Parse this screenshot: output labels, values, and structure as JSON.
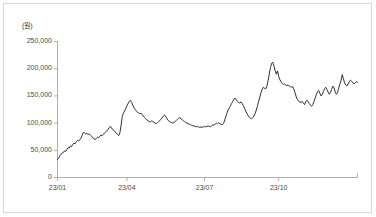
{
  "chart_data": {
    "type": "line",
    "title": "",
    "subtitle": "",
    "unit_label": "(원)",
    "xlabel": "",
    "ylabel": "",
    "ylim": [
      0,
      250000
    ],
    "xlim": [
      "23/01",
      "23/12"
    ],
    "grid": false,
    "legend": null,
    "legend_position": "none",
    "line_color": "#1a1a1a",
    "axis_color": "#9a9a9a",
    "frame_color": "#d8d8d8",
    "background_color": "#ffffff",
    "ytick_labels": [
      "250,000",
      "200,000",
      "150,000",
      "100,000",
      "50,000",
      "0"
    ],
    "ytick_values": [
      250000,
      200000,
      150000,
      100000,
      50000,
      0
    ],
    "xtick_labels": [
      "23/01",
      "23/04",
      "23/07",
      "23/10"
    ],
    "xtick_values": [
      0,
      59,
      125,
      188
    ],
    "x_index_max": 250,
    "annotations": [],
    "series": [
      {
        "name": "price",
        "values": [
          33000,
          36000,
          40000,
          43000,
          45000,
          46000,
          49000,
          48000,
          52000,
          55000,
          54000,
          58000,
          57000,
          61000,
          63000,
          62000,
          66000,
          68000,
          67000,
          70000,
          72000,
          78000,
          83000,
          82000,
          80000,
          81000,
          79000,
          80000,
          78000,
          76000,
          73000,
          71000,
          70000,
          72000,
          74000,
          73000,
          76000,
          78000,
          77000,
          79000,
          82000,
          84000,
          86000,
          88000,
          92000,
          94000,
          91000,
          88000,
          86000,
          84000,
          82000,
          79000,
          77000,
          82000,
          95000,
          112000,
          118000,
          122000,
          127000,
          132000,
          136000,
          140000,
          142000,
          138000,
          133000,
          128000,
          125000,
          122000,
          120000,
          119000,
          117000,
          118000,
          116000,
          113000,
          110000,
          108000,
          106000,
          104000,
          103000,
          102000,
          104000,
          103000,
          101000,
          100000,
          99000,
          101000,
          103000,
          105000,
          107000,
          110000,
          113000,
          115000,
          112000,
          108000,
          105000,
          103000,
          102000,
          101000,
          100000,
          101000,
          103000,
          105000,
          107000,
          109000,
          110000,
          108000,
          106000,
          104000,
          103000,
          101000,
          100000,
          99000,
          98000,
          97000,
          96000,
          95000,
          95000,
          94000,
          93000,
          94000,
          93000,
          92000,
          93000,
          92000,
          93000,
          94000,
          93000,
          94000,
          95000,
          94000,
          93000,
          95000,
          97000,
          96000,
          98000,
          100000,
          99000,
          101000,
          99000,
          98000,
          97000,
          99000,
          104000,
          112000,
          118000,
          124000,
          128000,
          132000,
          136000,
          140000,
          144000,
          146000,
          143000,
          140000,
          138000,
          137000,
          139000,
          136000,
          132000,
          127000,
          122000,
          118000,
          114000,
          111000,
          109000,
          108000,
          110000,
          113000,
          118000,
          124000,
          132000,
          140000,
          148000,
          156000,
          162000,
          166000,
          164000,
          163000,
          168000,
          178000,
          190000,
          202000,
          210000,
          212000,
          205000,
          196000,
          190000,
          196000,
          186000,
          180000,
          176000,
          173000,
          171000,
          172000,
          170000,
          169000,
          170000,
          168000,
          167000,
          166000,
          167000,
          162000,
          155000,
          148000,
          143000,
          140000,
          139000,
          138000,
          140000,
          137000,
          134000,
          139000,
          142000,
          140000,
          136000,
          133000,
          131000,
          134000,
          140000,
          146000,
          152000,
          158000,
          160000,
          155000,
          150000,
          152000,
          158000,
          163000,
          166000,
          162000,
          157000,
          153000,
          156000,
          162000,
          168000,
          165000,
          158000,
          153000,
          156000,
          164000,
          172000,
          178000,
          189000,
          182000,
          174000,
          170000,
          168000,
          172000,
          176000,
          179000,
          177000,
          174000,
          172000,
          174000,
          176000,
          175000
        ]
      }
    ]
  }
}
